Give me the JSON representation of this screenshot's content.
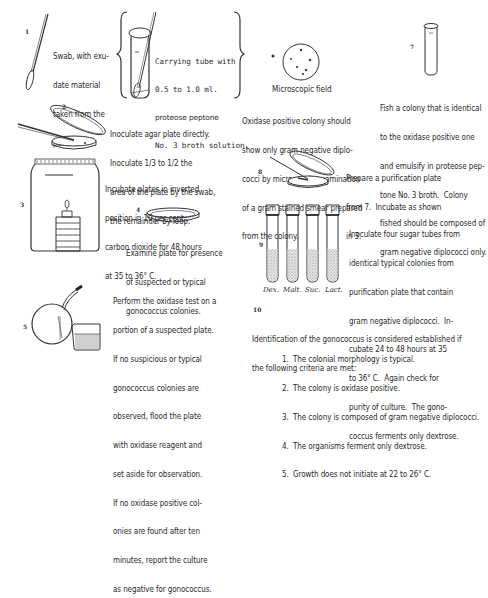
{
  "steps": [
    {
      "number": "1",
      "text": [
        "Swab, with exu-",
        "date material",
        "taken from the",
        "patient."
      ]
    },
    {
      "number": "",
      "text": [
        "Carrying tube with",
        "0.5 to 1.0 ml.",
        "proteose peptone",
        "No. 3 broth solution."
      ]
    },
    {
      "number": "2",
      "text": [
        "Inoculate agar plate directly.",
        "Inoculate 1/3 to 1/2 the",
        "area of the plate by the swab,",
        "the remainder by loop."
      ]
    },
    {
      "number": "3",
      "text": [
        "Incubate plates in inverted",
        "position in 10 per cent",
        "carbon dioxide for 48 hours",
        "at 35 to 36° C."
      ]
    },
    {
      "number": "4",
      "text": [
        "Examine plate for presence",
        "of suspected or typical",
        "gonococcus colonies."
      ]
    },
    {
      "number": "5",
      "text": [
        "Perform the oxidase test on a",
        "portion of a suspected plate.",
        "If no suspicious or typical",
        "gonococcus colonies are",
        "observed, flood the plate",
        "with oxidase reagent and",
        "set aside for observation.",
        "If no oxidase positive col-",
        "onies are found after ten",
        "minutes, report the culture",
        "as negative for gonococcus."
      ]
    },
    {
      "number": "6",
      "caption": "Microscopic field",
      "text": [
        "Oxidase positive colony should",
        "show only gram negative diplo-",
        "cocci by microscopic examination",
        "of a gram stained smear prepared",
        "from the colony."
      ]
    },
    {
      "number": "7",
      "text": [
        "Fish a colony that is identical",
        "to the oxidase positive one",
        "and emulsify in proteose pep-",
        "tone No. 3 broth.  Colony",
        "fished should be composed of",
        "gram negative diplococci only."
      ]
    },
    {
      "number": "8",
      "text": [
        "Prepare a purification plate",
        "from 7.  Incubate as shown",
        "in 3."
      ]
    },
    {
      "number": "9",
      "tube_labels": [
        "Dex.",
        "Malt.",
        "Suc.",
        "Lact."
      ],
      "text": [
        "Inoculate four sugar tubes from",
        "identical typical colonies from",
        "purification plate that contain",
        "gram negative diplococci.  In-",
        "cubate 24 to 48 hours at 35",
        "to 36° C.  Again check for",
        "purity of culture.  The gono-",
        "coccus ferments only dextrose."
      ]
    },
    {
      "number": "10",
      "intro": [
        "Identification of the gonococcus is considered established if",
        "the following criteria are met:"
      ],
      "criteria": [
        "1.  The colonial morphology is typical.",
        "2.  The colony is oxidase positive.",
        "3.  The colony is composed of gram negative diplococci.",
        "4.  The organisms ferment only dextrose.",
        "5.  Growth does not initiate at 22 to 26° C."
      ]
    }
  ],
  "colors": {
    "ink": "#2a2a2a",
    "background": "#ffffff"
  }
}
